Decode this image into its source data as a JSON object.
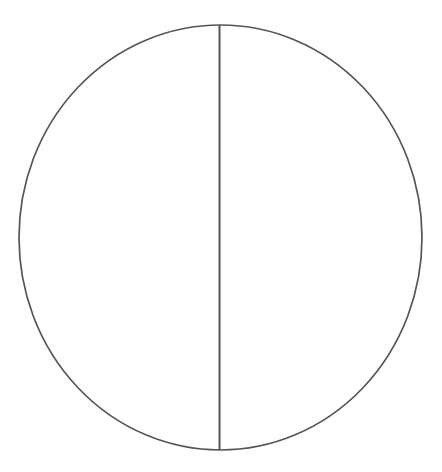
{
  "canvas": {
    "width": 442,
    "height": 472,
    "background_color": "#ffffff"
  },
  "figure": {
    "title": "",
    "stroke_color": "#555555",
    "fill_color": "none"
  },
  "chart_data": {
    "type": "diagram",
    "title": "",
    "shapes": [
      {
        "name": "circle-outline",
        "kind": "ellipse",
        "center_x": 220.5,
        "center_y": 237.5,
        "radius_x": 201.5,
        "radius_y": 212.5,
        "stroke": "#555555",
        "stroke_width": 1.7,
        "fill": "none"
      },
      {
        "name": "vertical-diameter",
        "kind": "line",
        "x1": 219.5,
        "y1": 25.0,
        "x2": 219.5,
        "y2": 450.0,
        "stroke": "#555555",
        "stroke_width": 2.0
      }
    ],
    "labels": [],
    "legend": [],
    "grid": false
  }
}
